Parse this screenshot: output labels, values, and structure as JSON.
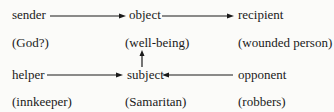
{
  "diagram": {
    "type": "actantial-model",
    "nodes": {
      "sender": {
        "label": "sender",
        "example": "(God?)"
      },
      "object": {
        "label": "object",
        "example": "(well-being)"
      },
      "recipient": {
        "label": "recipient",
        "example": "(wounded person)"
      },
      "helper": {
        "label": "helper",
        "example": "(innkeeper)"
      },
      "subject": {
        "label": "subject",
        "example": "(Samaritan)"
      },
      "opponent": {
        "label": "opponent",
        "example": "(robbers)"
      }
    },
    "edges": [
      {
        "from": "sender",
        "to": "object"
      },
      {
        "from": "object",
        "to": "recipient"
      },
      {
        "from": "subject",
        "to": "object"
      },
      {
        "from": "helper",
        "to": "subject"
      },
      {
        "from": "opponent",
        "to": "subject"
      }
    ]
  }
}
